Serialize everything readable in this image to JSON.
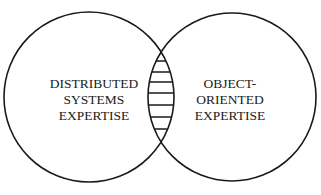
{
  "diagram": {
    "type": "venn",
    "left_set": {
      "lines": [
        "DISTRIBUTED",
        "SYSTEMS",
        "EXPERTISE"
      ]
    },
    "right_set": {
      "lines": [
        "OBJECT-",
        "ORIENTED",
        "EXPERTISE"
      ]
    },
    "intersection": {
      "fill": "horizontal-hatching"
    },
    "colors": {
      "stroke": "#1a1a1a",
      "background": "#ffffff"
    }
  }
}
